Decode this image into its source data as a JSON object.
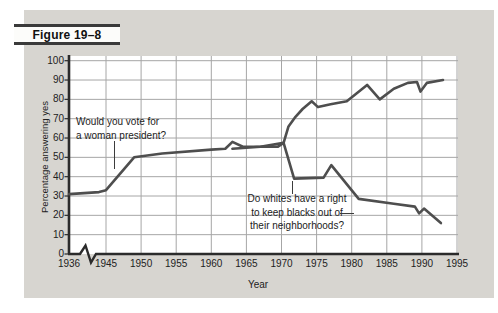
{
  "figure": {
    "label": "Figure 19–8"
  },
  "chart_data": {
    "type": "line",
    "title": "",
    "xlabel": "Year",
    "ylabel": "Percentage answering yes",
    "x_ticks": [
      1936,
      1945,
      1950,
      1955,
      1960,
      1965,
      1970,
      1975,
      1980,
      1985,
      1990,
      1995
    ],
    "y_ticks": [
      0,
      10,
      20,
      30,
      40,
      50,
      60,
      70,
      80,
      90,
      100
    ],
    "ylim": [
      0,
      100
    ],
    "grid": true,
    "x_axis_break": "zigzag break on x-axis between 1936 and 1945",
    "legend_position": "none (labels are in-plot annotations)",
    "series": [
      {
        "name": "Would you vote for a woman president?",
        "points": [
          [
            1936,
            31
          ],
          [
            1944,
            32
          ],
          [
            1945,
            33
          ],
          [
            1949,
            50
          ],
          [
            1953,
            52
          ],
          [
            1960,
            54
          ],
          [
            1962,
            54.5
          ],
          [
            1963,
            58
          ],
          [
            1964.5,
            55.5
          ],
          [
            1969.5,
            55.5
          ],
          [
            1970.3,
            57.5
          ],
          [
            1971,
            66
          ],
          [
            1972,
            71
          ],
          [
            1973,
            75
          ],
          [
            1974.3,
            79
          ],
          [
            1975.2,
            76
          ],
          [
            1977,
            77.5
          ],
          [
            1979.3,
            79
          ],
          [
            1982.2,
            87.5
          ],
          [
            1984,
            80
          ],
          [
            1986,
            85.5
          ],
          [
            1988,
            88.5
          ],
          [
            1989.3,
            89
          ],
          [
            1989.8,
            84
          ],
          [
            1990.7,
            88.5
          ],
          [
            1993,
            90
          ]
        ]
      },
      {
        "name": "Do whites have a right to keep blacks out of their neighborhoods?",
        "points": [
          [
            1963,
            54.5
          ],
          [
            1967,
            55.5
          ],
          [
            1970.3,
            57.5
          ],
          [
            1971.8,
            39
          ],
          [
            1976,
            39.5
          ],
          [
            1977.1,
            46
          ],
          [
            1981,
            28.5
          ],
          [
            1986,
            26
          ],
          [
            1989,
            24.5
          ],
          [
            1989.6,
            21
          ],
          [
            1990.3,
            23.5
          ],
          [
            1992.7,
            16
          ]
        ]
      }
    ],
    "annotations": {
      "woman": "Would you vote for\na woman president?",
      "blacks": "Do whites have a right\nto keep blacks out of\ntheir neighborhoods?"
    }
  },
  "colors": {
    "panel_bg": "#d7d5d0",
    "plot_bg": "#ffffff",
    "grid": "#a6a6a6",
    "axis": "#2b2b2b",
    "line": "#4e4e4e",
    "text": "#1d1d1d"
  }
}
